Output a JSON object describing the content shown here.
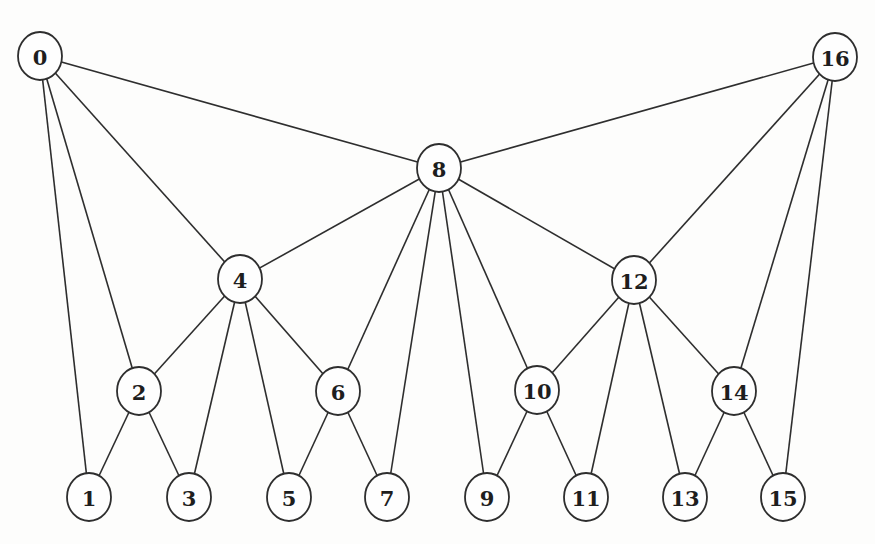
{
  "diagram": {
    "type": "graph",
    "colors": {
      "background": "#fdfdfc",
      "line": "#2e2e2e",
      "node_fill": "#fefefe",
      "label": "#1e1e1e"
    },
    "node_radius": {
      "rx": 22,
      "ry": 24
    },
    "nodes": [
      {
        "id": 0,
        "label": "0",
        "x": 40,
        "y": 56
      },
      {
        "id": 16,
        "label": "16",
        "x": 835,
        "y": 57
      },
      {
        "id": 8,
        "label": "8",
        "x": 439,
        "y": 168
      },
      {
        "id": 4,
        "label": "4",
        "x": 240,
        "y": 279
      },
      {
        "id": 12,
        "label": "12",
        "x": 634,
        "y": 280
      },
      {
        "id": 2,
        "label": "2",
        "x": 139,
        "y": 391
      },
      {
        "id": 6,
        "label": "6",
        "x": 338,
        "y": 391
      },
      {
        "id": 10,
        "label": "10",
        "x": 537,
        "y": 390
      },
      {
        "id": 14,
        "label": "14",
        "x": 734,
        "y": 391
      },
      {
        "id": 1,
        "label": "1",
        "x": 89,
        "y": 497
      },
      {
        "id": 3,
        "label": "3",
        "x": 189,
        "y": 497
      },
      {
        "id": 5,
        "label": "5",
        "x": 289,
        "y": 497
      },
      {
        "id": 7,
        "label": "7",
        "x": 387,
        "y": 497
      },
      {
        "id": 9,
        "label": "9",
        "x": 487,
        "y": 497
      },
      {
        "id": 11,
        "label": "11",
        "x": 586,
        "y": 497
      },
      {
        "id": 13,
        "label": "13",
        "x": 685,
        "y": 497
      },
      {
        "id": 15,
        "label": "15",
        "x": 783,
        "y": 497
      }
    ],
    "edges": [
      [
        0,
        1
      ],
      [
        0,
        2
      ],
      [
        0,
        4
      ],
      [
        0,
        8
      ],
      [
        2,
        1
      ],
      [
        2,
        3
      ],
      [
        2,
        4
      ],
      [
        4,
        3
      ],
      [
        4,
        5
      ],
      [
        4,
        6
      ],
      [
        4,
        8
      ],
      [
        6,
        5
      ],
      [
        6,
        7
      ],
      [
        6,
        8
      ],
      [
        8,
        7
      ],
      [
        8,
        9
      ],
      [
        8,
        10
      ],
      [
        8,
        12
      ],
      [
        8,
        16
      ],
      [
        10,
        9
      ],
      [
        10,
        11
      ],
      [
        10,
        12
      ],
      [
        12,
        11
      ],
      [
        12,
        13
      ],
      [
        12,
        14
      ],
      [
        12,
        16
      ],
      [
        14,
        13
      ],
      [
        14,
        15
      ],
      [
        14,
        16
      ],
      [
        16,
        15
      ]
    ]
  }
}
